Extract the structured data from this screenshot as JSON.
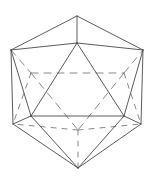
{
  "figure": {
    "shape_name": "Icosahedron",
    "background_color": "#ffffff",
    "visible_edge_color": "#4a4a4a",
    "hidden_edge_color": "#7d7d7d",
    "stroke_width": 0.9,
    "canvas": {
      "width": 153,
      "height": 179
    },
    "vertices": {
      "top_apex": {
        "id": "A",
        "x": 77,
        "y": 16,
        "label": "top apex"
      },
      "outer_upper_left": {
        "id": "B",
        "x": 11,
        "y": 50,
        "label": "outer upper left"
      },
      "outer_upper_right": {
        "id": "C",
        "x": 143,
        "y": 50,
        "label": "outer upper right"
      },
      "front_top": {
        "id": "D",
        "x": 77,
        "y": 43,
        "label": "front top"
      },
      "mid_left": {
        "id": "E",
        "x": 31,
        "y": 73,
        "label": "mid left"
      },
      "mid_right": {
        "id": "F",
        "x": 124,
        "y": 73,
        "label": "mid right"
      },
      "front_lower_left": {
        "id": "G",
        "x": 31,
        "y": 116,
        "label": "front lower left"
      },
      "front_lower_right": {
        "id": "H",
        "x": 124,
        "y": 116,
        "label": "front lower right"
      },
      "outer_lower_left": {
        "id": "I",
        "x": 13,
        "y": 124,
        "label": "outer lower left"
      },
      "outer_lower_right": {
        "id": "J",
        "x": 141,
        "y": 124,
        "label": "outer lower right"
      },
      "back_bottom": {
        "id": "K",
        "x": 78,
        "y": 130,
        "label": "back bottom hidden"
      },
      "bottom_apex": {
        "id": "L",
        "x": 78,
        "y": 168,
        "label": "bottom apex"
      }
    },
    "visible_edges": [
      {
        "name": "silhouette-top-left",
        "x1": 77,
        "y1": 16,
        "x2": 11,
        "y2": 50
      },
      {
        "name": "silhouette-top-right",
        "x1": 77,
        "y1": 16,
        "x2": 143,
        "y2": 50
      },
      {
        "name": "silhouette-left",
        "x1": 11,
        "y1": 50,
        "x2": 13,
        "y2": 124
      },
      {
        "name": "silhouette-right",
        "x1": 143,
        "y1": 50,
        "x2": 141,
        "y2": 124
      },
      {
        "name": "silhouette-bottom-left",
        "x1": 13,
        "y1": 124,
        "x2": 78,
        "y2": 168
      },
      {
        "name": "silhouette-bottom-right",
        "x1": 141,
        "y1": 124,
        "x2": 78,
        "y2": 168
      },
      {
        "name": "apex-to-front-top",
        "x1": 77,
        "y1": 16,
        "x2": 77,
        "y2": 43
      },
      {
        "name": "front-top-to-upper-left",
        "x1": 77,
        "y1": 43,
        "x2": 11,
        "y2": 50
      },
      {
        "name": "front-top-to-upper-right",
        "x1": 77,
        "y1": 43,
        "x2": 143,
        "y2": 50
      },
      {
        "name": "front-top-to-lower-left",
        "x1": 77,
        "y1": 43,
        "x2": 31,
        "y2": 116
      },
      {
        "name": "front-top-to-lower-right",
        "x1": 77,
        "y1": 43,
        "x2": 124,
        "y2": 116
      },
      {
        "name": "front-band-left",
        "x1": 11,
        "y1": 50,
        "x2": 31,
        "y2": 116
      },
      {
        "name": "front-band-right",
        "x1": 143,
        "y1": 50,
        "x2": 124,
        "y2": 116
      },
      {
        "name": "front-base",
        "x1": 31,
        "y1": 116,
        "x2": 124,
        "y2": 116
      },
      {
        "name": "lower-left-corner-in",
        "x1": 13,
        "y1": 124,
        "x2": 31,
        "y2": 116
      },
      {
        "name": "lower-right-corner-in",
        "x1": 141,
        "y1": 124,
        "x2": 124,
        "y2": 116
      },
      {
        "name": "lower-left-to-bottom-in",
        "x1": 31,
        "y1": 116,
        "x2": 78,
        "y2": 168
      },
      {
        "name": "lower-right-to-bottom-in",
        "x1": 124,
        "y1": 116,
        "x2": 78,
        "y2": 168
      }
    ],
    "hidden_edges": [
      {
        "name": "hidden-equator-left",
        "x1": 11,
        "y1": 50,
        "x2": 31,
        "y2": 73
      },
      {
        "name": "hidden-equator-mid",
        "x1": 31,
        "y1": 73,
        "x2": 124,
        "y2": 73
      },
      {
        "name": "hidden-equator-right",
        "x1": 124,
        "y1": 73,
        "x2": 143,
        "y2": 50
      },
      {
        "name": "hidden-left-diagonal",
        "x1": 31,
        "y1": 73,
        "x2": 13,
        "y2": 124
      },
      {
        "name": "hidden-right-diagonal",
        "x1": 124,
        "y1": 73,
        "x2": 141,
        "y2": 124
      },
      {
        "name": "hidden-left-to-back",
        "x1": 31,
        "y1": 73,
        "x2": 78,
        "y2": 130
      },
      {
        "name": "hidden-right-to-back",
        "x1": 124,
        "y1": 73,
        "x2": 78,
        "y2": 130
      },
      {
        "name": "hidden-back-to-bottom",
        "x1": 78,
        "y1": 130,
        "x2": 78,
        "y2": 168
      },
      {
        "name": "hidden-back-to-lower-left",
        "x1": 78,
        "y1": 130,
        "x2": 13,
        "y2": 124
      },
      {
        "name": "hidden-back-to-lower-right",
        "x1": 78,
        "y1": 130,
        "x2": 141,
        "y2": 124
      }
    ]
  }
}
